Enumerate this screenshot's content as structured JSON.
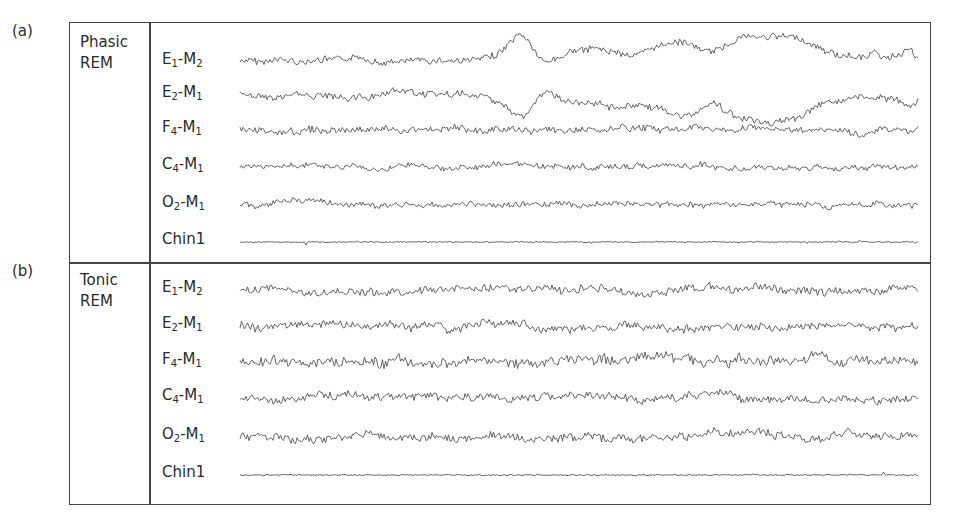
{
  "figure": {
    "panels": [
      {
        "tag": "(a)",
        "state_line1": "Phasic",
        "state_line2": "REM",
        "channels": [
          {
            "base": "E",
            "sub1": "1",
            "sep": "-M",
            "sub2": "2",
            "y": 62,
            "amp": 6,
            "type": "eog1"
          },
          {
            "base": "E",
            "sub1": "2",
            "sep": "-M",
            "sub2": "1",
            "y": 95,
            "amp": 6,
            "type": "eog2"
          },
          {
            "base": "F",
            "sub1": "4",
            "sep": "-M",
            "sub2": "1",
            "y": 130,
            "amp": 6,
            "type": "eeg"
          },
          {
            "base": "C",
            "sub1": "4",
            "sep": "-M",
            "sub2": "1",
            "y": 167,
            "amp": 5,
            "type": "eeg"
          },
          {
            "base": "O",
            "sub1": "2",
            "sep": "-M",
            "sub2": "1",
            "y": 205,
            "amp": 5,
            "type": "eeg"
          },
          {
            "base": "Chin1",
            "sub1": "",
            "sep": "",
            "sub2": "",
            "y": 242,
            "amp": 2,
            "type": "emg"
          }
        ]
      },
      {
        "tag": "(b)",
        "state_line1": "Tonic",
        "state_line2": "REM",
        "channels": [
          {
            "base": "E",
            "sub1": "1",
            "sep": "-M",
            "sub2": "2",
            "y": 290,
            "amp": 7,
            "type": "eeg"
          },
          {
            "base": "E",
            "sub1": "2",
            "sep": "-M",
            "sub2": "1",
            "y": 326,
            "amp": 7,
            "type": "eeg"
          },
          {
            "base": "F",
            "sub1": "4",
            "sep": "-M",
            "sub2": "1",
            "y": 362,
            "amp": 9,
            "type": "eeg"
          },
          {
            "base": "C",
            "sub1": "4",
            "sep": "-M",
            "sub2": "1",
            "y": 398,
            "amp": 7,
            "type": "eeg"
          },
          {
            "base": "O",
            "sub1": "2",
            "sep": "-M",
            "sub2": "1",
            "y": 437,
            "amp": 7,
            "type": "eeg"
          },
          {
            "base": "Chin1",
            "sub1": "",
            "sep": "",
            "sub2": "",
            "y": 475,
            "amp": 2,
            "type": "emg"
          }
        ]
      }
    ],
    "colors": {
      "border": "#444444",
      "trace": "#555555",
      "text": "#2a2a2a"
    }
  }
}
